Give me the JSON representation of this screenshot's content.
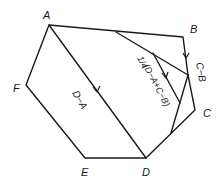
{
  "diagram": {
    "title": "",
    "vertices": [
      {
        "id": "A",
        "label": "A",
        "x": 49,
        "y": 25
      },
      {
        "id": "B",
        "label": "B",
        "x": 183,
        "y": 37
      },
      {
        "id": "C",
        "label": "C",
        "x": 195,
        "y": 110
      },
      {
        "id": "D",
        "label": "D",
        "x": 146,
        "y": 158
      },
      {
        "id": "E",
        "label": "E",
        "x": 85,
        "y": 158
      },
      {
        "id": "F",
        "label": "F",
        "x": 26,
        "y": 85
      }
    ],
    "vector_labels": {
      "d_minus_a": "D−A",
      "c_minus_b": "C−B",
      "average": "(D−A+C−B)",
      "fraction": "1/4"
    },
    "colors": {
      "stroke": "#1a1a1a",
      "background": "#ffffff"
    }
  }
}
